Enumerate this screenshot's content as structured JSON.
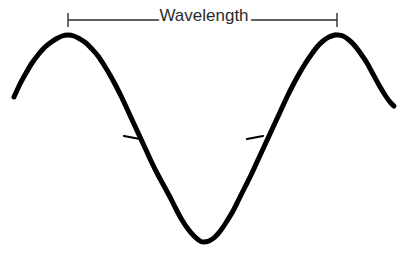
{
  "figure": {
    "title_text": "Wavelength",
    "background_color": "#ffffff",
    "curve_color": "#000000",
    "annotation_color": "#2b2b2b",
    "text_color": "#2b2b2b",
    "width": 409,
    "height": 255
  },
  "annotation": {
    "label": "Wavelength",
    "label_x": 204,
    "label_y": 21,
    "label_font_size": 17,
    "dimension_line_y": 20,
    "dimension_line_x1": 68,
    "dimension_line_x2": 337,
    "end_tick_half_height": 7,
    "line_width": 1.4
  },
  "midline_ticks": [
    {
      "name": "left-midline-tick",
      "x1": 124,
      "y1": 136,
      "x2": 140,
      "y2": 139
    },
    {
      "name": "right-midline-tick",
      "x1": 247,
      "y1": 139,
      "x2": 263,
      "y2": 136
    }
  ],
  "chart_data": {
    "type": "line",
    "title": "Wavelength",
    "xlabel": "",
    "ylabel": "",
    "grid": false,
    "legend": "none",
    "xlim": [
      14,
      394
    ],
    "ylim": [
      35,
      242
    ],
    "curve": {
      "name": "cosine-wave",
      "stroke_width": 5,
      "wavelength_px": 269,
      "crest_y": 35,
      "trough_y": 242,
      "midline_y": 138.5,
      "amplitude_px": 103.5,
      "x_start": 14,
      "x_end": 394,
      "crests_x": [
        68,
        337
      ],
      "troughs_x": [
        203
      ],
      "points": [
        [
          14,
          97
        ],
        [
          20,
          84
        ],
        [
          26,
          73
        ],
        [
          32,
          63
        ],
        [
          38,
          55
        ],
        [
          44,
          48
        ],
        [
          50,
          43
        ],
        [
          56,
          39
        ],
        [
          62,
          36
        ],
        [
          68,
          35
        ],
        [
          74,
          36
        ],
        [
          80,
          39
        ],
        [
          86,
          43
        ],
        [
          92,
          49
        ],
        [
          98,
          56
        ],
        [
          104,
          65
        ],
        [
          110,
          75
        ],
        [
          116,
          86
        ],
        [
          122,
          98
        ],
        [
          128,
          111
        ],
        [
          134,
          124
        ],
        [
          140,
          137
        ],
        [
          146,
          150
        ],
        [
          152,
          163
        ],
        [
          158,
          175
        ],
        [
          164,
          186
        ],
        [
          170,
          197
        ],
        [
          176,
          209
        ],
        [
          182,
          220
        ],
        [
          188,
          229
        ],
        [
          194,
          236
        ],
        [
          200,
          241
        ],
        [
          203,
          242
        ],
        [
          209,
          241
        ],
        [
          215,
          237
        ],
        [
          221,
          230
        ],
        [
          227,
          221
        ],
        [
          233,
          211
        ],
        [
          239,
          199
        ],
        [
          245,
          187
        ],
        [
          251,
          175
        ],
        [
          257,
          162
        ],
        [
          263,
          149
        ],
        [
          269,
          136
        ],
        [
          275,
          123
        ],
        [
          281,
          110
        ],
        [
          287,
          97
        ],
        [
          293,
          85
        ],
        [
          299,
          74
        ],
        [
          305,
          64
        ],
        [
          311,
          55
        ],
        [
          317,
          47
        ],
        [
          323,
          41
        ],
        [
          329,
          37
        ],
        [
          335,
          35
        ],
        [
          337,
          35
        ],
        [
          343,
          36
        ],
        [
          349,
          40
        ],
        [
          355,
          46
        ],
        [
          361,
          54
        ],
        [
          367,
          63
        ],
        [
          373,
          74
        ],
        [
          379,
          85
        ],
        [
          385,
          95
        ],
        [
          390,
          102
        ],
        [
          394,
          106
        ]
      ]
    },
    "annotations": [
      {
        "text": "Wavelength",
        "type": "dimension",
        "from_x": 68,
        "to_x": 337,
        "y": 20,
        "span_px": 269
      }
    ]
  }
}
